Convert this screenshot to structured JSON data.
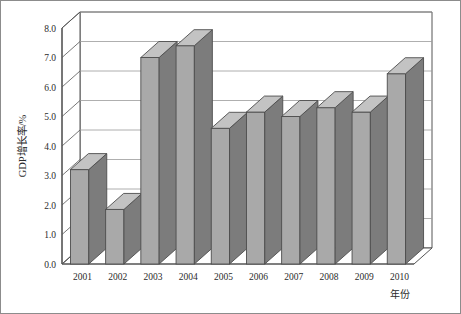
{
  "chart_data": {
    "type": "bar",
    "title": "",
    "subtitle": "",
    "xlabel": "年份",
    "ylabel": "GDP增长率/%",
    "categories": [
      "2001",
      "2002",
      "2003",
      "2004",
      "2005",
      "2006",
      "2007",
      "2008",
      "2009",
      "2010"
    ],
    "values": [
      3.2,
      1.85,
      7.0,
      7.4,
      4.6,
      5.15,
      5.0,
      5.3,
      5.15,
      6.45
    ],
    "series": [
      {
        "name": "GDP增长率",
        "values": [
          3.2,
          1.85,
          7.0,
          7.4,
          4.6,
          5.15,
          5.0,
          5.3,
          5.15,
          6.45
        ]
      }
    ],
    "ylim": [
      0.0,
      8.0
    ],
    "ytick_step": 1.0,
    "ytick_labels": [
      "0.0",
      "1.0",
      "2.0",
      "3.0",
      "4.0",
      "5.0",
      "6.0",
      "7.0",
      "8.0"
    ],
    "grid": true,
    "grid_axis": "y",
    "legend": false,
    "legend_position": "none",
    "style": "3d-column",
    "bar_face_color": "#a9a9a9",
    "bar_side_color": "#7c7c7c",
    "bar_top_color": "#c3c3c3",
    "plot_background": "#ffffff",
    "grid_color": "#9a9a9a",
    "axis_color": "#555555",
    "frame_color": "#8c8c8c",
    "annotations": []
  },
  "chart_frame": {
    "border_label": "chart-outer-frame"
  }
}
